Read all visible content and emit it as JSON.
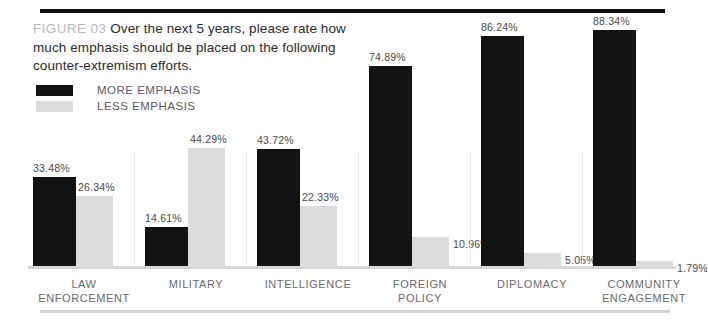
{
  "figure": {
    "label": "FIGURE 03",
    "caption": "Over the next 5 years, please rate how much emphasis should be placed on the following counter-extremism efforts."
  },
  "legend": {
    "items": [
      {
        "name": "more-emphasis",
        "label": "MORE EMPHASIS",
        "color": "#131313"
      },
      {
        "name": "less-emphasis",
        "label": "LESS EMPHASIS",
        "color": "#dcdcdc"
      }
    ]
  },
  "chart_data": {
    "type": "bar",
    "title": "Over the next 5 years, please rate how much emphasis should be placed on the following counter-extremism efforts.",
    "xlabel": "",
    "ylabel": "",
    "ylim": [
      0,
      100
    ],
    "grid": false,
    "legend_position": "top-left",
    "categories": [
      "LAW ENFORCEMENT",
      "MILITARY",
      "INTELLIGENCE",
      "FOREIGN POLICY",
      "DIPLOMACY",
      "COMMUNITY ENGAGEMENT"
    ],
    "category_lines": [
      [
        "LAW",
        "ENFORCEMENT"
      ],
      [
        "MILITARY"
      ],
      [
        "INTELLIGENCE"
      ],
      [
        "FOREIGN",
        "POLICY"
      ],
      [
        "DIPLOMACY"
      ],
      [
        "COMMUNITY",
        "ENGAGEMENT"
      ]
    ],
    "series": [
      {
        "name": "MORE EMPHASIS",
        "color": "#131313",
        "values": [
          33.48,
          14.61,
          43.72,
          74.89,
          86.24,
          88.34
        ],
        "labels": [
          "33.48%",
          "14.61%",
          "43.72%",
          "74.89%",
          "86.24%",
          "88.34%"
        ]
      },
      {
        "name": "LESS EMPHASIS",
        "color": "#dcdcdc",
        "values": [
          26.34,
          44.29,
          22.33,
          10.96,
          5.05,
          1.79
        ],
        "labels": [
          "26.34%",
          "44.29%",
          "22.33%",
          "10.96%",
          "5.05%",
          "1.79%"
        ]
      }
    ]
  },
  "colors": {
    "rule_top": "#111111",
    "rule_baseline": "#d8d8d8",
    "rule_bottom": "#d4d4d4",
    "caption_text": "#2b2b2b",
    "figure_label": "#b9b9b9",
    "category_text": "#6a6a6a",
    "value_text": "#4a4a4a"
  }
}
